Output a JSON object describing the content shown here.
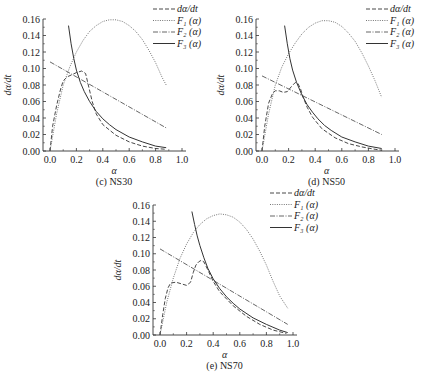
{
  "chart_data": [
    {
      "id": "c",
      "type": "line",
      "caption": "(c)  NS30",
      "xlabel": "α",
      "ylabel": "dα/dt",
      "xlim": [
        0.0,
        1.0
      ],
      "ylim": [
        0.0,
        0.16
      ],
      "xticks": [
        "0.0",
        "0.2",
        "0.4",
        "0.6",
        "0.8",
        "1.0"
      ],
      "yticks": [
        "0.00",
        "0.02",
        "0.04",
        "0.06",
        "0.08",
        "0.10",
        "0.12",
        "0.14",
        "0.16"
      ],
      "grid": false,
      "legend_position": "upper right",
      "legend": [
        "dα/dt",
        "F₁ (α)",
        "F₂ (α)",
        "F₃ (α)"
      ],
      "series": [
        {
          "name": "dα/dt",
          "style": "dashed",
          "x": [
            0.0,
            0.02,
            0.05,
            0.08,
            0.1,
            0.13,
            0.16,
            0.2,
            0.24,
            0.27,
            0.29,
            0.32,
            0.35,
            0.4,
            0.5,
            0.6,
            0.7,
            0.8,
            0.88
          ],
          "y": [
            0.0,
            0.03,
            0.055,
            0.075,
            0.085,
            0.09,
            0.092,
            0.095,
            0.097,
            0.094,
            0.08,
            0.06,
            0.045,
            0.032,
            0.019,
            0.011,
            0.006,
            0.003,
            0.002
          ]
        },
        {
          "name": "F₁ (α)",
          "style": "dotted",
          "x": [
            0.0,
            0.05,
            0.1,
            0.15,
            0.2,
            0.25,
            0.3,
            0.35,
            0.4,
            0.45,
            0.5,
            0.55,
            0.6,
            0.65,
            0.7,
            0.75,
            0.8,
            0.85,
            0.88
          ],
          "y": [
            0.0,
            0.045,
            0.08,
            0.102,
            0.12,
            0.134,
            0.145,
            0.152,
            0.157,
            0.159,
            0.159,
            0.157,
            0.152,
            0.145,
            0.135,
            0.122,
            0.107,
            0.089,
            0.08
          ]
        },
        {
          "name": "F₂ (α)",
          "style": "dashdot",
          "x": [
            0.0,
            0.88
          ],
          "y": [
            0.108,
            0.028
          ]
        },
        {
          "name": "F₃ (α)",
          "style": "solid",
          "x": [
            0.14,
            0.16,
            0.18,
            0.2,
            0.23,
            0.26,
            0.3,
            0.35,
            0.4,
            0.45,
            0.5,
            0.6,
            0.7,
            0.8,
            0.88
          ],
          "y": [
            0.152,
            0.13,
            0.112,
            0.098,
            0.083,
            0.072,
            0.06,
            0.048,
            0.039,
            0.032,
            0.026,
            0.017,
            0.011,
            0.006,
            0.004
          ]
        }
      ]
    },
    {
      "id": "d",
      "type": "line",
      "caption": "(d)  NS50",
      "xlabel": "α",
      "ylabel": "dα/dt",
      "xlim": [
        0.0,
        1.0
      ],
      "ylim": [
        0.0,
        0.16
      ],
      "xticks": [
        "0.0",
        "0.2",
        "0.4",
        "0.6",
        "0.8",
        "1.0"
      ],
      "yticks": [
        "0.00",
        "0.02",
        "0.04",
        "0.06",
        "0.08",
        "0.10",
        "0.12",
        "0.14",
        "0.16"
      ],
      "grid": false,
      "legend_position": "upper right",
      "legend": [
        "dα/dt",
        "F₁ (α)",
        "F₂ (α)",
        "F₃ (α)"
      ],
      "series": [
        {
          "name": "dα/dt",
          "style": "dashed",
          "x": [
            0.0,
            0.02,
            0.05,
            0.08,
            0.1,
            0.13,
            0.16,
            0.19,
            0.22,
            0.25,
            0.27,
            0.29,
            0.31,
            0.34,
            0.38,
            0.45,
            0.55,
            0.65,
            0.75,
            0.85,
            0.9
          ],
          "y": [
            0.0,
            0.03,
            0.058,
            0.07,
            0.073,
            0.073,
            0.071,
            0.072,
            0.078,
            0.083,
            0.082,
            0.075,
            0.065,
            0.053,
            0.041,
            0.027,
            0.016,
            0.009,
            0.005,
            0.002,
            0.001
          ]
        },
        {
          "name": "F₁ (α)",
          "style": "dotted",
          "x": [
            0.0,
            0.05,
            0.1,
            0.15,
            0.2,
            0.25,
            0.3,
            0.35,
            0.4,
            0.45,
            0.5,
            0.55,
            0.6,
            0.65,
            0.7,
            0.75,
            0.8,
            0.85,
            0.9
          ],
          "y": [
            0.0,
            0.045,
            0.08,
            0.102,
            0.118,
            0.131,
            0.142,
            0.15,
            0.155,
            0.158,
            0.158,
            0.156,
            0.151,
            0.143,
            0.133,
            0.119,
            0.103,
            0.085,
            0.065
          ]
        },
        {
          "name": "F₂ (α)",
          "style": "dashdot",
          "x": [
            0.0,
            0.9
          ],
          "y": [
            0.091,
            0.02
          ]
        },
        {
          "name": "F₃ (α)",
          "style": "solid",
          "x": [
            0.17,
            0.19,
            0.21,
            0.23,
            0.26,
            0.3,
            0.34,
            0.38,
            0.42,
            0.47,
            0.52,
            0.6,
            0.7,
            0.8,
            0.9
          ],
          "y": [
            0.152,
            0.13,
            0.112,
            0.098,
            0.083,
            0.068,
            0.056,
            0.047,
            0.039,
            0.031,
            0.025,
            0.017,
            0.011,
            0.006,
            0.003
          ]
        }
      ]
    },
    {
      "id": "e",
      "type": "line",
      "caption": "(e)  NS70",
      "xlabel": "α",
      "ylabel": "dα/dt",
      "xlim": [
        0.0,
        1.0
      ],
      "ylim": [
        0.0,
        0.16
      ],
      "xticks": [
        "0.0",
        "0.2",
        "0.4",
        "0.6",
        "0.8",
        "1.0"
      ],
      "yticks": [
        "0.00",
        "0.02",
        "0.04",
        "0.06",
        "0.08",
        "0.10",
        "0.12",
        "0.14",
        "0.16"
      ],
      "grid": false,
      "legend_position": "upper right",
      "legend": [
        "dα/dt",
        "F₁ (α)",
        "F₂ (α)",
        "F₃ (α)"
      ],
      "series": [
        {
          "name": "dα/dt",
          "style": "dashed",
          "x": [
            0.0,
            0.02,
            0.04,
            0.06,
            0.08,
            0.12,
            0.16,
            0.2,
            0.23,
            0.25,
            0.27,
            0.29,
            0.31,
            0.33,
            0.36,
            0.4,
            0.45,
            0.55,
            0.65,
            0.75,
            0.85,
            0.95
          ],
          "y": [
            0.0,
            0.025,
            0.045,
            0.058,
            0.064,
            0.065,
            0.063,
            0.061,
            0.065,
            0.077,
            0.086,
            0.09,
            0.092,
            0.09,
            0.08,
            0.066,
            0.053,
            0.036,
            0.023,
            0.013,
            0.006,
            0.002
          ]
        },
        {
          "name": "F₁ (α)",
          "style": "dotted",
          "x": [
            0.0,
            0.05,
            0.1,
            0.15,
            0.2,
            0.25,
            0.3,
            0.35,
            0.4,
            0.45,
            0.5,
            0.55,
            0.6,
            0.65,
            0.7,
            0.75,
            0.8,
            0.85,
            0.9,
            0.96
          ],
          "y": [
            0.0,
            0.04,
            0.07,
            0.094,
            0.112,
            0.126,
            0.136,
            0.143,
            0.147,
            0.149,
            0.148,
            0.145,
            0.139,
            0.13,
            0.118,
            0.103,
            0.086,
            0.066,
            0.048,
            0.033
          ]
        },
        {
          "name": "F₂ (α)",
          "style": "dashdot",
          "x": [
            0.0,
            0.96
          ],
          "y": [
            0.106,
            0.013
          ]
        },
        {
          "name": "F₃ (α)",
          "style": "solid",
          "x": [
            0.24,
            0.26,
            0.28,
            0.3,
            0.33,
            0.36,
            0.4,
            0.45,
            0.5,
            0.55,
            0.6,
            0.7,
            0.8,
            0.9,
            0.96
          ],
          "y": [
            0.152,
            0.136,
            0.122,
            0.11,
            0.095,
            0.082,
            0.069,
            0.057,
            0.047,
            0.039,
            0.032,
            0.021,
            0.013,
            0.006,
            0.003
          ]
        }
      ]
    }
  ],
  "panels_layout": [
    {
      "axis_x": 43,
      "x0": 50,
      "x1": 182,
      "y0": 151,
      "y1": 19,
      "legend_x": 153,
      "legend_y": 6
    },
    {
      "axis_x": 256,
      "x0": 262,
      "x1": 395,
      "y0": 151,
      "y1": 19,
      "legend_x": 366,
      "legend_y": 6
    },
    {
      "axis_x": 153,
      "x0": 160,
      "x1": 293,
      "y0": 335,
      "y1": 205,
      "legend_x": 270,
      "legend_y": 190
    }
  ],
  "style": {
    "line_color": "#333333",
    "dotted_color": "#666666",
    "dashdot_color": "#555555"
  }
}
